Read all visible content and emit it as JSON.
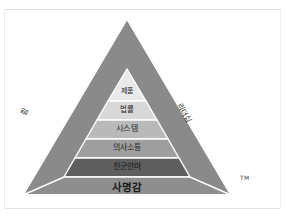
{
  "diagram": {
    "type": "pyramid",
    "title_mark": "TM",
    "background_color": "#ffffff",
    "tiers": [
      {
        "label": "제품",
        "fill": "#e9e9e9",
        "text_color": "#1f1f1f"
      },
      {
        "label": "법률",
        "fill": "#d8d8d8",
        "text_color": "#1f1f1f"
      },
      {
        "label": "시스템",
        "fill": "#b9b9b9",
        "text_color": "#1f1f1f"
      },
      {
        "label": "의사소통",
        "fill": "#9e9e9e",
        "text_color": "#1f1f1f"
      },
      {
        "label": "천군만마",
        "fill": "#5e5e5e",
        "text_color": "#1a1a1a"
      },
      {
        "label": "사명감",
        "fill": "#8e8e8e",
        "text_color": "#1a1a1a"
      }
    ],
    "side_labels": {
      "left": "힘",
      "right": "리더십"
    },
    "face_color": "#8a8a8a",
    "outline_color": "#ffffff"
  }
}
